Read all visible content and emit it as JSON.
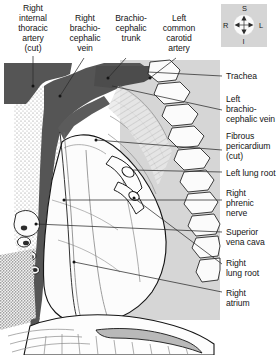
{
  "figure": {
    "colors": {
      "vessel_dark": "#555555",
      "vertebra_panel": "#d6d6d6",
      "rib_shade": "#c9c9c9",
      "lung_fill": "#fbfbfb",
      "outline": "#1a1a1a",
      "leader_line": "#2b2b2b",
      "rose_bg": "#d5d5d5",
      "background": "#ffffff"
    }
  },
  "orientation": {
    "name": "orientation-rose",
    "superior": "S",
    "inferior": "I",
    "right": "R",
    "left": "L"
  },
  "top_labels": [
    {
      "id": "right-internal-thoracic-artery",
      "text": "Right\ninternal\nthoracic\nartery\n(cut)",
      "x": 4,
      "y": 3,
      "width": 58
    },
    {
      "id": "right-brachiocephalic-vein",
      "text": "Right\nbrachio-\ncephalic\nvein",
      "x": 62,
      "y": 13,
      "width": 46
    },
    {
      "id": "brachiocephalic-trunk",
      "text": "Brachio-\ncephalic\ntrunk",
      "x": 108,
      "y": 13,
      "width": 46
    },
    {
      "id": "left-common-carotid-artery",
      "text": "Left\ncommon\ncarotid\nartery",
      "x": 154,
      "y": 13,
      "width": 50
    }
  ],
  "right_labels": [
    {
      "id": "trachea",
      "text": "Trachea",
      "x": 226,
      "y": 71
    },
    {
      "id": "left-brachiocephalic-vein",
      "text": "Left\nbrachio-\ncephalic vein",
      "x": 226,
      "y": 94
    },
    {
      "id": "fibrous-pericardium-cut",
      "text": "Fibrous\npericardium\n(cut)",
      "x": 226,
      "y": 131
    },
    {
      "id": "left-lung-root",
      "text": "Left lung root",
      "x": 226,
      "y": 168
    },
    {
      "id": "right-phrenic-nerve",
      "text": "Right\nphrenic\nnerve",
      "x": 226,
      "y": 188
    },
    {
      "id": "superior-vena-cava",
      "text": "Superior\nvena cava",
      "x": 226,
      "y": 227
    },
    {
      "id": "right-lung-root",
      "text": "Right\nlung root",
      "x": 226,
      "y": 258
    },
    {
      "id": "right-atrium",
      "text": "Right\natrium",
      "x": 226,
      "y": 288
    }
  ]
}
